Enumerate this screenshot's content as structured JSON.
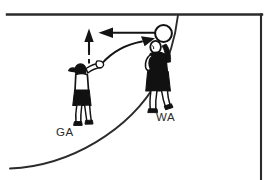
{
  "diagram": {
    "type": "sports-tactics-illustration",
    "colors": {
      "line": "#2b2b2b",
      "ink": "#141414",
      "fill_white": "#ffffff",
      "fill_black": "#111111",
      "label_text": "#2b2b2b",
      "background": "#ffffff"
    },
    "court": {
      "top_boundary_label": "goal-line",
      "right_boundary_label": "side-line",
      "goal_circle_label": "goal-circle-arc"
    },
    "players": [
      {
        "id": "ga",
        "label": "GA",
        "role": "Goal Attack",
        "top_color": "#ffffff",
        "skirt_color": "#111111",
        "has_ponytail": true,
        "action": "passing"
      },
      {
        "id": "wa",
        "label": "WA",
        "role": "Wing Attack",
        "top_color": "#111111",
        "skirt_color": "#111111",
        "has_ponytail": false,
        "action": "receiving"
      }
    ],
    "ball": {
      "label": "ball",
      "fill": "#ffffff",
      "stroke": "#111111"
    },
    "arrows": [
      {
        "id": "pass-arrow",
        "label": "pass to WA",
        "style": "solid-curved",
        "direction": "up-right"
      },
      {
        "id": "return-arrow",
        "label": "return pass",
        "style": "solid-straight",
        "direction": "left"
      },
      {
        "id": "movement-arrow",
        "label": "GA movement",
        "style": "dashed-then-solid",
        "direction": "up"
      }
    ]
  }
}
